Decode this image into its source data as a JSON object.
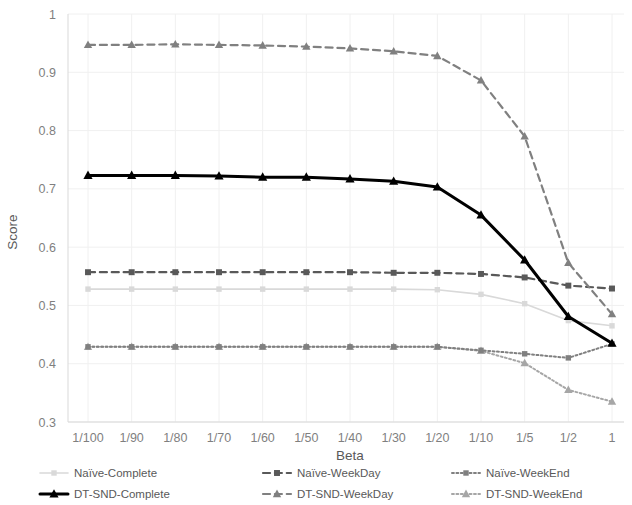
{
  "chart_data": {
    "type": "line",
    "title": "",
    "xlabel": "Beta",
    "ylabel": "Score",
    "categories": [
      "1/100",
      "1/90",
      "1/80",
      "1/70",
      "1/60",
      "1/50",
      "1/40",
      "1/30",
      "1/20",
      "1/10",
      "1/5",
      "1/2",
      "1"
    ],
    "ylim": [
      0.3,
      1
    ],
    "ytick_labels": [
      "0.3",
      "0.4",
      "0.5",
      "0.6",
      "0.7",
      "0.8",
      "0.9",
      "1"
    ],
    "yticks": [
      0.3,
      0.4,
      0.5,
      0.6,
      0.7,
      0.8,
      0.9,
      1
    ],
    "grid": true,
    "legend_position": "bottom",
    "series": [
      {
        "name": "Naive-Complete",
        "label": "Naïve-Complete",
        "color": "#d9d9d9",
        "marker": "square",
        "dash": "solid",
        "width": 1.6,
        "values": [
          0.528,
          0.528,
          0.528,
          0.528,
          0.528,
          0.528,
          0.528,
          0.528,
          0.527,
          0.519,
          0.503,
          0.474,
          0.465
        ]
      },
      {
        "name": "Naive-WeekDay",
        "label": "Naïve-WeekDay",
        "color": "#595959",
        "marker": "square",
        "dash": "dashed",
        "width": 2.2,
        "values": [
          0.557,
          0.557,
          0.557,
          0.557,
          0.557,
          0.557,
          0.557,
          0.556,
          0.556,
          0.554,
          0.548,
          0.534,
          0.529
        ]
      },
      {
        "name": "Naive-WeekEnd",
        "label": "Naïve-WeekEnd",
        "color": "#808080",
        "marker": "square",
        "dash": "dotted",
        "width": 2.0,
        "values": [
          0.429,
          0.429,
          0.429,
          0.429,
          0.429,
          0.429,
          0.429,
          0.429,
          0.429,
          0.423,
          0.417,
          0.41,
          0.434
        ]
      },
      {
        "name": "DT-SND-Complete",
        "label": "DT-SND-Complete",
        "color": "#000000",
        "marker": "triangle",
        "dash": "solid",
        "width": 3.0,
        "values": [
          0.723,
          0.723,
          0.723,
          0.722,
          0.72,
          0.72,
          0.717,
          0.713,
          0.703,
          0.655,
          0.578,
          0.481,
          0.435
        ]
      },
      {
        "name": "DT-SND-WeekDay",
        "label": "DT-SND-WeekDay",
        "color": "#808080",
        "marker": "triangle",
        "dash": "dashed",
        "width": 2.2,
        "values": [
          0.947,
          0.947,
          0.948,
          0.947,
          0.946,
          0.944,
          0.941,
          0.936,
          0.928,
          0.886,
          0.79,
          0.573,
          0.485
        ]
      },
      {
        "name": "DT-SND-WeekEnd",
        "label": "DT-SND-WeekEnd",
        "color": "#a6a6a6",
        "marker": "triangle",
        "dash": "dotted",
        "width": 2.0,
        "values": [
          0.429,
          0.429,
          0.429,
          0.429,
          0.429,
          0.429,
          0.429,
          0.429,
          0.429,
          0.422,
          0.401,
          0.355,
          0.335
        ]
      }
    ]
  },
  "legend": {
    "entries": [
      {
        "label": "Naïve-Complete",
        "series": "Naive-Complete"
      },
      {
        "label": "Naïve-WeekDay",
        "series": "Naive-WeekDay"
      },
      {
        "label": "Naïve-WeekEnd",
        "series": "Naive-WeekEnd"
      },
      {
        "label": "DT-SND-Complete",
        "series": "DT-SND-Complete"
      },
      {
        "label": "DT-SND-WeekDay",
        "series": "DT-SND-WeekDay"
      },
      {
        "label": "DT-SND-WeekEnd",
        "series": "DT-SND-WeekEnd"
      }
    ]
  }
}
